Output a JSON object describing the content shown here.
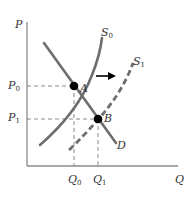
{
  "diagram": {
    "axes": {
      "y_label": "P",
      "x_label": "Q"
    },
    "price_labels": {
      "p0": {
        "base": "P",
        "sub": "0"
      },
      "p1": {
        "base": "P",
        "sub": "1"
      }
    },
    "quantity_labels": {
      "q0": {
        "base": "Q",
        "sub": "0"
      },
      "q1": {
        "base": "Q",
        "sub": "1"
      }
    },
    "curves": {
      "s0": {
        "base": "S",
        "sub": "0",
        "style": "solid"
      },
      "s1": {
        "base": "S",
        "sub": "1",
        "style": "dashed"
      },
      "d": {
        "label": "D",
        "style": "solid"
      }
    },
    "points": {
      "a": {
        "label": "A"
      },
      "b": {
        "label": "B"
      }
    },
    "shift_arrow": {
      "direction": "right"
    },
    "colors": {
      "curve": "#6e6e6e",
      "axis": "#8a8a8a",
      "guide": "#8a8a8a",
      "point": "#000000",
      "text": "#333333"
    }
  }
}
